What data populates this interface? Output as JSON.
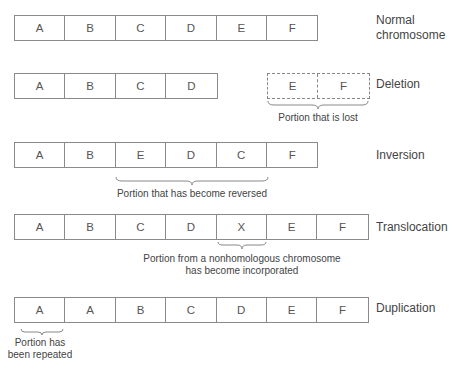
{
  "rows": {
    "normal": {
      "cells": [
        "A",
        "B",
        "C",
        "D",
        "E",
        "F"
      ],
      "label_line1": "Normal",
      "label_line2": "chromosome"
    },
    "deletion": {
      "cells": [
        "A",
        "B",
        "C",
        "D"
      ],
      "lost_cells": [
        "E",
        "F"
      ],
      "label": "Deletion",
      "caption": "Portion that is lost"
    },
    "inversion": {
      "cells": [
        "A",
        "B",
        "E",
        "D",
        "C",
        "F"
      ],
      "label": "Inversion",
      "caption": "Portion that has become reversed"
    },
    "translocation": {
      "cells": [
        "A",
        "B",
        "C",
        "D",
        "X",
        "E",
        "F"
      ],
      "label": "Translocation",
      "caption_line1": "Portion from a nonhomologous chromosome",
      "caption_line2": "has become incorporated"
    },
    "duplication": {
      "cells": [
        "A",
        "A",
        "B",
        "C",
        "D",
        "E",
        "F"
      ],
      "label": "Duplication",
      "caption_line1": "Portion has",
      "caption_line2": "been repeated"
    }
  },
  "colors": {
    "line": "#8a8a8a",
    "text": "#444444"
  }
}
